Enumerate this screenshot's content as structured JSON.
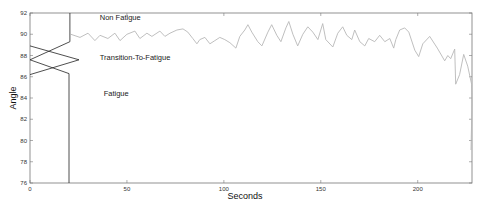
{
  "chart_data": {
    "type": "line",
    "title": "",
    "xlabel": "Seconds",
    "ylabel": "Angle",
    "xlim": [
      0,
      228
    ],
    "ylim": [
      76,
      92
    ],
    "grid": false,
    "x_ticks": [
      0,
      50,
      100,
      150,
      200
    ],
    "y_ticks": [
      76,
      78,
      80,
      82,
      84,
      86,
      88,
      90,
      92
    ],
    "annotations": [
      {
        "text": "Non Fatigue",
        "x": 36,
        "y": 91.3
      },
      {
        "text": "Transition-To-Fatigue",
        "x": 36,
        "y": 87.6
      },
      {
        "text": "Fatigue",
        "x": 38,
        "y": 84.2
      }
    ],
    "membership_lines": {
      "description": "Fuzzy region boundaries drawn near the y-axis (x in seconds, y in angle)",
      "non_fatigue": [
        [
          20.6,
          92
        ],
        [
          20.6,
          89.3
        ],
        [
          0,
          87.6
        ]
      ],
      "transition": [
        [
          0,
          88.9
        ],
        [
          25.3,
          87.6
        ],
        [
          0,
          86.2
        ]
      ],
      "fatigue": [
        [
          0,
          87.6
        ],
        [
          20.1,
          86.3
        ],
        [
          20.1,
          76
        ]
      ]
    },
    "series": [
      {
        "name": "Angle",
        "color": "#b8b8b8",
        "x": [
          21.1,
          25.8,
          29.9,
          33.5,
          36.1,
          40.2,
          43.8,
          46.4,
          50.0,
          54.1,
          56.7,
          60.3,
          62.9,
          67.0,
          69.6,
          72.2,
          75.8,
          78.9,
          81.4,
          84.0,
          86.1,
          87.6,
          90.2,
          92.8,
          95.4,
          97.9,
          100.5,
          103.1,
          106.2,
          108.2,
          110.8,
          112.4,
          114.4,
          117.5,
          119.6,
          122.7,
          124.7,
          127.3,
          129.4,
          132.0,
          133.5,
          135.6,
          138.1,
          140.7,
          143.3,
          145.9,
          148.5,
          151.0,
          152.6,
          156.2,
          158.8,
          161.3,
          163.4,
          166.0,
          167.5,
          170.1,
          172.7,
          174.7,
          177.8,
          180.4,
          183.0,
          185.6,
          187.6,
          188.7,
          190.7,
          193.3,
          195.4,
          198.5,
          200.5,
          202.6,
          206.2,
          210.1,
          213.9,
          215.5,
          217.0,
          219.1,
          219.6,
          221.6,
          223.7,
          225.8,
          227.8,
          229.9
        ],
        "y": [
          90.0,
          89.7,
          90.1,
          89.4,
          89.9,
          89.6,
          90.1,
          89.4,
          90.0,
          90.3,
          89.6,
          90.1,
          89.8,
          90.3,
          89.8,
          90.1,
          90.4,
          90.5,
          90.2,
          89.6,
          89.1,
          89.5,
          89.7,
          89.1,
          89.4,
          89.7,
          89.5,
          89.2,
          88.7,
          89.8,
          90.4,
          90.9,
          90.2,
          89.3,
          88.9,
          90.2,
          90.9,
          89.9,
          89.3,
          90.6,
          91.2,
          90.0,
          88.9,
          90.0,
          90.7,
          90.2,
          89.5,
          91.0,
          89.5,
          88.8,
          90.1,
          90.7,
          89.9,
          89.5,
          90.4,
          89.3,
          88.9,
          89.6,
          89.3,
          89.9,
          89.3,
          89.6,
          88.7,
          89.5,
          90.4,
          90.6,
          90.2,
          88.5,
          87.9,
          89.1,
          89.8,
          88.7,
          87.5,
          88.0,
          87.7,
          88.6,
          85.3,
          86.2,
          88.1,
          87.0,
          85.3,
          83.5
        ]
      }
    ]
  }
}
